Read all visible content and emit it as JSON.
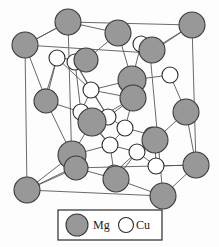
{
  "figure": {
    "type": "crystal-structure-diagram",
    "background_color": "#fdfdfd"
  },
  "styles": {
    "mg_fill": "#989898",
    "mg_stroke": "#3a3a3a",
    "cu_fill": "#ffffff",
    "cu_stroke": "#2a2a2a",
    "bond_color": "#55555a",
    "cell_edge_color": "#6a6a70",
    "legend_border": "#2a2a2a"
  },
  "legend": {
    "box": {
      "x": 58,
      "y": 210,
      "width": 104,
      "height": 30
    },
    "entries": [
      {
        "symbol_name": "mg-atom-swatch",
        "label": "Mg",
        "fill": "#989898",
        "stroke": "#3a3a3a",
        "cx": 77,
        "cy": 225,
        "r": 11,
        "label_x": 93,
        "label_y": 229
      },
      {
        "symbol_name": "cu-atom-swatch",
        "label": "Cu",
        "fill": "#ffffff",
        "stroke": "#2a2a2a",
        "cx": 126,
        "cy": 225,
        "r": 7.5,
        "label_x": 136,
        "label_y": 229
      }
    ]
  },
  "unit_cell": {
    "front_face": [
      {
        "x": 25,
        "y": 45
      },
      {
        "x": 150,
        "y": 53
      },
      {
        "x": 163,
        "y": 196
      },
      {
        "x": 27,
        "y": 190
      }
    ],
    "back_face": [
      {
        "x": 68,
        "y": 22
      },
      {
        "x": 192,
        "y": 25
      },
      {
        "x": 196,
        "y": 165
      },
      {
        "x": 72,
        "y": 168
      }
    ],
    "edges": [
      [
        25,
        45,
        150,
        53
      ],
      [
        150,
        53,
        163,
        196
      ],
      [
        163,
        196,
        27,
        190
      ],
      [
        27,
        190,
        25,
        45
      ],
      [
        68,
        22,
        192,
        25
      ],
      [
        192,
        25,
        196,
        165
      ],
      [
        196,
        165,
        72,
        168
      ],
      [
        72,
        168,
        68,
        22
      ],
      [
        25,
        45,
        68,
        22
      ],
      [
        150,
        53,
        192,
        25
      ],
      [
        163,
        196,
        196,
        165
      ],
      [
        27,
        190,
        72,
        168
      ]
    ]
  },
  "atoms": {
    "mg": [
      {
        "id": "mg-corner-front-top-left",
        "cx": 25,
        "cy": 45,
        "r": 13
      },
      {
        "id": "mg-corner-back-top-left",
        "cx": 68,
        "cy": 22,
        "r": 13
      },
      {
        "id": "mg-corner-back-top-mid",
        "cx": 118,
        "cy": 33,
        "r": 13
      },
      {
        "id": "mg-corner-back-top-right",
        "cx": 192,
        "cy": 25,
        "r": 13
      },
      {
        "id": "mg-corner-front-top-right",
        "cx": 152,
        "cy": 50,
        "r": 13
      },
      {
        "id": "mg-interior-upper-left",
        "cx": 86,
        "cy": 60,
        "r": 12
      },
      {
        "id": "mg-interior-upper-right",
        "cx": 132,
        "cy": 80,
        "r": 14
      },
      {
        "id": "mg-interior-center-right",
        "cx": 133,
        "cy": 98,
        "r": 13
      },
      {
        "id": "mg-left-face-mid",
        "cx": 46,
        "cy": 101,
        "r": 12
      },
      {
        "id": "mg-interior-center",
        "cx": 92,
        "cy": 122,
        "r": 14
      },
      {
        "id": "mg-right-face-mid",
        "cx": 186,
        "cy": 112,
        "r": 13
      },
      {
        "id": "mg-interior-lower-right",
        "cx": 155,
        "cy": 140,
        "r": 13
      },
      {
        "id": "mg-interior-lower-left",
        "cx": 72,
        "cy": 155,
        "r": 14
      },
      {
        "id": "mg-interior-lower-left-b",
        "cx": 76,
        "cy": 168,
        "r": 12
      },
      {
        "id": "mg-bottom-face-mid",
        "cx": 116,
        "cy": 179,
        "r": 13
      },
      {
        "id": "mg-corner-front-bottom-left",
        "cx": 27,
        "cy": 190,
        "r": 13
      },
      {
        "id": "mg-corner-back-bottom-right",
        "cx": 196,
        "cy": 165,
        "r": 13
      },
      {
        "id": "mg-corner-front-bottom-right",
        "cx": 163,
        "cy": 196,
        "r": 13
      }
    ],
    "cu": [
      {
        "id": "cu-top-left-a",
        "cx": 57,
        "cy": 58,
        "r": 8
      },
      {
        "id": "cu-top-left-b",
        "cx": 75,
        "cy": 62,
        "r": 8
      },
      {
        "id": "cu-top-right-a",
        "cx": 141,
        "cy": 44,
        "r": 8
      },
      {
        "id": "cu-top-right-b",
        "cx": 170,
        "cy": 75,
        "r": 8
      },
      {
        "id": "cu-mid-left",
        "cx": 45,
        "cy": 97,
        "r": 8
      },
      {
        "id": "cu-mid-center-a",
        "cx": 91,
        "cy": 90,
        "r": 8
      },
      {
        "id": "cu-mid-center-b",
        "cx": 81,
        "cy": 112,
        "r": 8
      },
      {
        "id": "cu-mid-center-c",
        "cx": 108,
        "cy": 117,
        "r": 8
      },
      {
        "id": "cu-mid-right-a",
        "cx": 125,
        "cy": 128,
        "r": 8
      },
      {
        "id": "cu-mid-right-b",
        "cx": 152,
        "cy": 135,
        "r": 8
      },
      {
        "id": "cu-lower-center-a",
        "cx": 110,
        "cy": 145,
        "r": 8
      },
      {
        "id": "cu-lower-center-b",
        "cx": 137,
        "cy": 152,
        "r": 8
      },
      {
        "id": "cu-lower-right",
        "cx": 156,
        "cy": 166,
        "r": 8
      },
      {
        "id": "cu-lower-left",
        "cx": 114,
        "cy": 173,
        "r": 8
      }
    ]
  },
  "bonds": [
    [
      25,
      45,
      68,
      22
    ],
    [
      68,
      22,
      118,
      33
    ],
    [
      86,
      60,
      57,
      58
    ],
    [
      86,
      60,
      75,
      62
    ],
    [
      57,
      58,
      45,
      97
    ],
    [
      75,
      62,
      91,
      90
    ],
    [
      57,
      58,
      91,
      90
    ],
    [
      75,
      62,
      81,
      112
    ],
    [
      86,
      60,
      118,
      33
    ],
    [
      132,
      80,
      141,
      44
    ],
    [
      132,
      80,
      170,
      75
    ],
    [
      132,
      80,
      118,
      33
    ],
    [
      141,
      44,
      152,
      50
    ],
    [
      170,
      75,
      186,
      112
    ],
    [
      133,
      98,
      108,
      117
    ],
    [
      133,
      98,
      125,
      128
    ],
    [
      132,
      80,
      91,
      90
    ],
    [
      91,
      90,
      108,
      117
    ],
    [
      91,
      90,
      81,
      112
    ],
    [
      81,
      112,
      92,
      122
    ],
    [
      92,
      122,
      108,
      117
    ],
    [
      92,
      122,
      110,
      145
    ],
    [
      92,
      122,
      72,
      155
    ],
    [
      45,
      97,
      46,
      101
    ],
    [
      46,
      101,
      81,
      112
    ],
    [
      46,
      101,
      72,
      155
    ],
    [
      125,
      128,
      152,
      135
    ],
    [
      125,
      128,
      110,
      145
    ],
    [
      152,
      135,
      155,
      140
    ],
    [
      155,
      140,
      156,
      166
    ],
    [
      155,
      140,
      186,
      112
    ],
    [
      110,
      145,
      137,
      152
    ],
    [
      137,
      152,
      156,
      166
    ],
    [
      110,
      145,
      114,
      173
    ],
    [
      114,
      173,
      116,
      179
    ],
    [
      116,
      179,
      163,
      196
    ],
    [
      72,
      155,
      76,
      168
    ],
    [
      76,
      168,
      116,
      179
    ],
    [
      72,
      155,
      27,
      190
    ],
    [
      76,
      168,
      27,
      190
    ],
    [
      72,
      155,
      110,
      145
    ],
    [
      156,
      166,
      196,
      165
    ],
    [
      116,
      179,
      137,
      152
    ],
    [
      108,
      117,
      125,
      128
    ],
    [
      133,
      98,
      92,
      122
    ],
    [
      186,
      112,
      196,
      165
    ],
    [
      152,
      50,
      192,
      25
    ],
    [
      45,
      97,
      25,
      45
    ],
    [
      137,
      152,
      155,
      140
    ],
    [
      114,
      173,
      137,
      152
    ],
    [
      81,
      112,
      110,
      145
    ],
    [
      91,
      90,
      133,
      98
    ],
    [
      75,
      62,
      108,
      117
    ],
    [
      57,
      58,
      46,
      101
    ]
  ]
}
